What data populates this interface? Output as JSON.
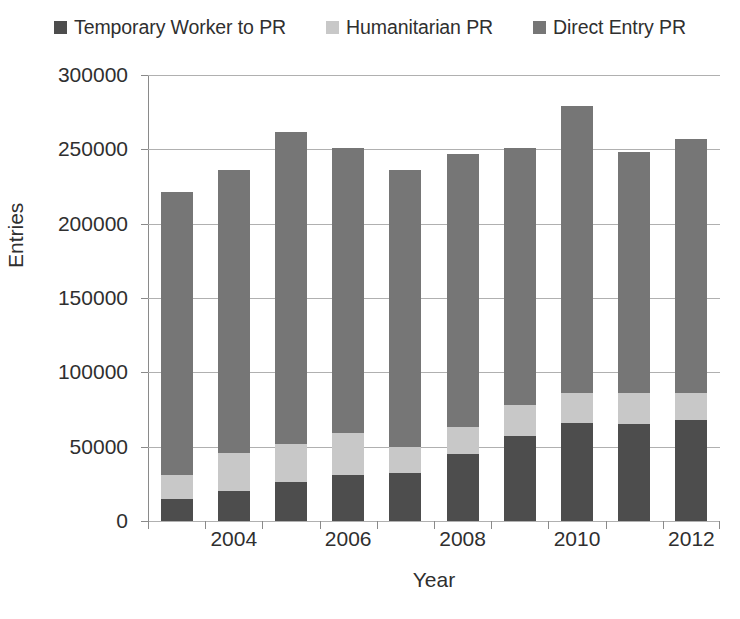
{
  "chart_data": {
    "type": "bar",
    "subtype": "stacked-vertical",
    "title": "",
    "xlabel": "Year",
    "ylabel": "Entries",
    "ylim": [
      0,
      300000
    ],
    "ytick_step": 50000,
    "yticks": [
      "0",
      "50000",
      "100000",
      "150000",
      "200000",
      "250000",
      "300000"
    ],
    "grid": true,
    "legend_position": "top",
    "categories": [
      "2002",
      "2003",
      "2004",
      "2005",
      "2006",
      "2007",
      "2008",
      "2009",
      "2010",
      "2011"
    ],
    "xtick_labels": [
      "2004",
      "2006",
      "2008",
      "2010",
      "2012"
    ],
    "xtick_label_indices": [
      2,
      4,
      6,
      8,
      10
    ],
    "series": [
      {
        "name": "Temporary Worker to PR",
        "color": "#4d4d4d",
        "values": [
          15000,
          20000,
          26000,
          31000,
          32000,
          45000,
          57000,
          66000,
          65000,
          68000
        ]
      },
      {
        "name": "Humanitarian PR",
        "color": "#c8c8c8",
        "values": [
          16000,
          26000,
          26000,
          28000,
          18000,
          18000,
          21000,
          20000,
          21000,
          18000
        ]
      },
      {
        "name": "Direct Entry PR",
        "color": "#767676",
        "values": [
          190000,
          190000,
          210000,
          192000,
          186000,
          184000,
          173000,
          193000,
          162000,
          171000
        ]
      }
    ],
    "totals": [
      221000,
      236000,
      262000,
      251000,
      236000,
      247000,
      251000,
      279000,
      248000,
      257000
    ]
  },
  "legend": {
    "items": [
      {
        "label": "Temporary Worker to PR",
        "color": "#4d4d4d"
      },
      {
        "label": "Humanitarian PR",
        "color": "#c8c8c8"
      },
      {
        "label": "Direct Entry PR",
        "color": "#767676"
      }
    ]
  },
  "axes": {
    "x_title": "Year",
    "y_title": "Entries"
  }
}
